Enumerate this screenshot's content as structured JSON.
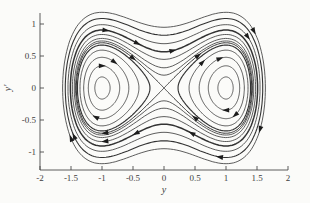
{
  "meta": {
    "flow_direction": "clockwise"
  },
  "colors": {
    "background": "#fbfbf9",
    "ink": "#333333",
    "arrow": "#1c1c1c",
    "axis": "#4a4a4a"
  },
  "chart_data": {
    "type": "line",
    "kind": "phase-portrait",
    "title": "",
    "xlabel": "y",
    "ylabel": "y'",
    "xlim": [
      -2,
      2
    ],
    "ylim": [
      -1.28,
      1.17
    ],
    "grid": false,
    "legend": null,
    "x_ticks": [
      -2,
      -1.5,
      -1,
      -0.5,
      0,
      0.5,
      1,
      1.5,
      2
    ],
    "x_tick_labels": [
      "-2",
      "-1.5",
      "-1",
      "-0.5",
      "0",
      "0.5",
      "1",
      "1.5",
      "2"
    ],
    "y_ticks": [
      -1,
      -0.5,
      0,
      0.5,
      1
    ],
    "y_tick_labels": [
      "-1",
      "-0.5",
      "0",
      "0.5",
      "1"
    ],
    "system": "y'' = y - y^3",
    "energy_function": "E = v^2/2 - y^2/2 + y^4/4",
    "equilibria": {
      "centers": [
        [
          -1,
          0
        ],
        [
          1,
          0
        ]
      ],
      "saddle": [
        [
          0,
          0
        ]
      ]
    },
    "separatrix": {
      "energy": 0,
      "x_intercepts": [
        -1.414,
        1.414
      ]
    },
    "inner_orbit_energies": [
      -0.235,
      -0.19,
      -0.135,
      -0.075,
      -0.025
    ],
    "outer_orbit_energies": [
      0.02,
      0.05,
      0.1,
      0.16,
      0.24,
      0.34,
      0.45
    ],
    "inner_orbit_widths": [
      0.8,
      0.8,
      0.8,
      0.8,
      1.15
    ],
    "outer_orbit_widths": [
      0.8,
      0.8,
      0.8,
      1.5,
      0.8,
      1.1,
      0.8
    ],
    "separatrix_width": 1.0,
    "arrows": [
      {
        "E": 0.16,
        "y": -0.94,
        "s": 1
      },
      {
        "E": 0.16,
        "y": -0.43,
        "s": 1
      },
      {
        "E": 0.16,
        "y": 0.14,
        "s": 1
      },
      {
        "E": 0.45,
        "y": 1.45,
        "s": 1
      },
      {
        "E": 0.24,
        "y": 1.35,
        "s": 1
      },
      {
        "E": 0,
        "y": -0.5,
        "s": 1
      },
      {
        "E": 0,
        "y": 0.55,
        "s": 1
      },
      {
        "E": -0.135,
        "y": -0.8,
        "s": 1
      },
      {
        "E": -0.19,
        "y": -1.0,
        "s": 1
      },
      {
        "E": -0.135,
        "y": 0.9,
        "s": 1
      },
      {
        "E": -0.075,
        "y": 0.62,
        "s": 1
      },
      {
        "E": 0.16,
        "y": 0.45,
        "s": -1
      },
      {
        "E": 0.16,
        "y": -0.45,
        "s": -1
      },
      {
        "E": 0.1,
        "y": -0.95,
        "s": -1
      },
      {
        "E": 0.34,
        "y": 0.9,
        "s": -1
      },
      {
        "E": 0.45,
        "y": -1.5,
        "s": -1
      },
      {
        "E": 0.34,
        "y": -1.45,
        "s": -1
      },
      {
        "E": 0.45,
        "y": 1.55,
        "s": -1
      },
      {
        "E": 0,
        "y": -0.95,
        "s": -1
      },
      {
        "E": 0,
        "y": 0.5,
        "s": -1
      },
      {
        "E": -0.135,
        "y": -1.1,
        "s": -1
      },
      {
        "E": -0.135,
        "y": 1.15,
        "s": -1
      },
      {
        "E": -0.19,
        "y": 1.0,
        "s": -1
      }
    ]
  }
}
